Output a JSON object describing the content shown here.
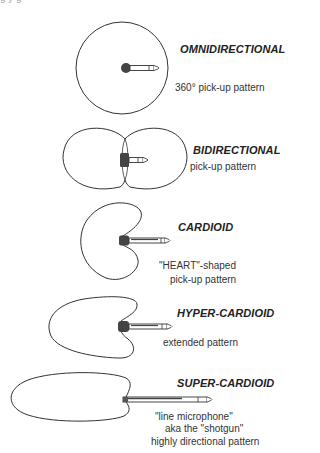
{
  "figure": {
    "top_cutoff_text": "g       y          g",
    "patterns": [
      {
        "name": "OMNIDIRECTIONAL",
        "description": [
          "360°  pick-up pattern"
        ],
        "shape": "circle"
      },
      {
        "name": "BIDIRECTIONAL",
        "description": [
          "pick-up pattern"
        ],
        "shape": "figure-eight"
      },
      {
        "name": "CARDIOID",
        "description": [
          "\"HEART\"-shaped",
          "pick-up pattern"
        ],
        "shape": "cardioid"
      },
      {
        "name": "HYPER-CARDIOID",
        "description": [
          "extended pattern"
        ],
        "shape": "hyper-cardioid"
      },
      {
        "name": "SUPER-CARDIOID",
        "description": [
          "\"line microphone\"",
          "aka the \"shotgun\"",
          "highly directional pattern"
        ],
        "shape": "super-cardioid"
      }
    ],
    "colors": {
      "line": "#333333",
      "mic_head": "#555555",
      "text": "#222222"
    }
  }
}
